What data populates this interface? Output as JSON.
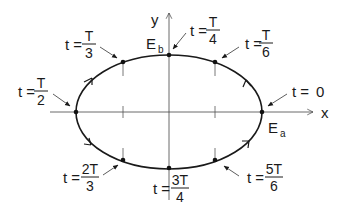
{
  "diagram": {
    "type": "elliptical orbit / phase diagram",
    "axes": {
      "x_label": "x",
      "y_label": "y"
    },
    "points": {
      "Ea": {
        "label": "E",
        "subscript": "a"
      },
      "Eb": {
        "label": "E",
        "subscript": "b"
      }
    },
    "time_labels": [
      {
        "id": "t0",
        "prefix": "t =",
        "value": "0"
      },
      {
        "id": "t6",
        "prefix": "t =",
        "num": "T",
        "den": "6"
      },
      {
        "id": "t4",
        "prefix": "t =",
        "num": "T",
        "den": "4"
      },
      {
        "id": "t3",
        "prefix": "t =",
        "num": "T",
        "den": "3"
      },
      {
        "id": "t2",
        "prefix": "t =",
        "num": "T",
        "den": "2"
      },
      {
        "id": "t23",
        "prefix": "t =",
        "num": "2T",
        "den": "3"
      },
      {
        "id": "t34",
        "prefix": "t =",
        "num": "3T",
        "den": "4"
      },
      {
        "id": "t56",
        "prefix": "t =",
        "num": "5T",
        "den": "6"
      }
    ],
    "direction": "counter-clockwise",
    "colors": {
      "ink": "#1a1a1a",
      "axis": "#444444",
      "background": "#ffffff"
    }
  }
}
